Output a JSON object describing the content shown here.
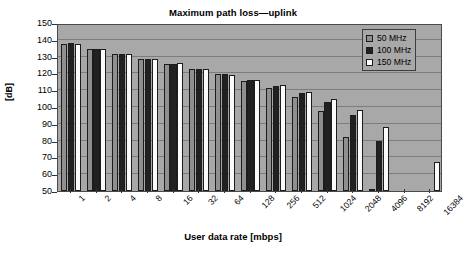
{
  "chart_data": {
    "type": "bar",
    "title": "Maximum path loss—uplink",
    "xlabel": "User data rate [mbps]",
    "ylabel": "[dB]",
    "ylim": [
      50,
      150
    ],
    "ytick_step": 10,
    "yticks": [
      150,
      140,
      130,
      120,
      110,
      100,
      90,
      80,
      70,
      60,
      50
    ],
    "grid": true,
    "legend_position": "top-right",
    "categories": [
      "1",
      "2",
      "4",
      "8",
      "16",
      "32",
      "64",
      "128",
      "256",
      "512",
      "1024",
      "2048",
      "4096",
      "8192",
      "16384"
    ],
    "series": [
      {
        "name": "50 MHz",
        "color": "#8f8f8f",
        "values": [
          137.5,
          134.5,
          131.5,
          128.5,
          125.5,
          122.5,
          119.5,
          115.5,
          111.5,
          106,
          97.5,
          82,
          51,
          null,
          null
        ]
      },
      {
        "name": "100 MHz",
        "color": "#212121",
        "values": [
          138,
          134.5,
          131.5,
          128.5,
          125.5,
          122.5,
          119.5,
          116,
          112.5,
          108.5,
          103,
          95,
          79.5,
          null,
          null
        ]
      },
      {
        "name": "150 MHz",
        "color": "#fbfbfb",
        "values": [
          137.5,
          134.5,
          131.5,
          128.5,
          126,
          122.5,
          119,
          116,
          113,
          109,
          104.5,
          98.5,
          88,
          null,
          67
        ]
      }
    ]
  },
  "legend": {
    "entries": [
      {
        "label": "50 MHz",
        "swatch": "gray-swatch"
      },
      {
        "label": "100 MHz",
        "swatch": "black-swatch"
      },
      {
        "label": "150 MHz",
        "swatch": "white-swatch"
      }
    ]
  }
}
